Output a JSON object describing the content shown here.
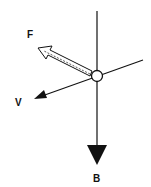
{
  "diagram": {
    "colors": {
      "line": "#111111",
      "background": "#ffffff"
    },
    "labels": {
      "F": "F",
      "V": "V",
      "B": "B"
    },
    "elements": [
      {
        "id": "object",
        "type": "circle",
        "center": [
          97,
          76
        ],
        "r": 5.5
      },
      {
        "id": "vertical-line",
        "type": "line",
        "from": [
          97,
          11
        ],
        "to": [
          97,
          148
        ]
      },
      {
        "id": "velocity-line",
        "type": "line",
        "from": [
          143,
          60
        ],
        "to": [
          34,
          99
        ]
      },
      {
        "id": "force-F",
        "type": "hollow-arrow",
        "from": [
          92,
          74
        ],
        "to": [
          38,
          48
        ],
        "label": "F"
      },
      {
        "id": "force-V",
        "type": "solid-arrow",
        "tip": [
          34,
          99
        ],
        "label": "V"
      },
      {
        "id": "force-B",
        "type": "solid-arrow",
        "tip": [
          97,
          165
        ],
        "label": "B"
      }
    ]
  }
}
